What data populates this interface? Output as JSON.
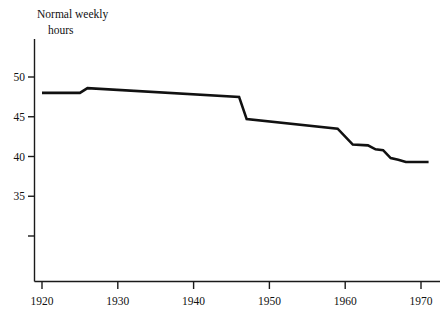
{
  "chart_data": {
    "type": "line",
    "title": "",
    "subtitle": "",
    "ylabel_lines": [
      "Normal weekly",
      "hours"
    ],
    "xlabel": "",
    "ylabel": "Normal weekly hours",
    "grid": false,
    "legend": false,
    "legend_position": "none",
    "xlim": [
      1920,
      1971
    ],
    "ylim": [
      28.5,
      53.5
    ],
    "xticks": [
      1920,
      1930,
      1940,
      1950,
      1960,
      1970
    ],
    "xtick_labels": [
      "1920",
      "1930",
      "1940",
      "1950",
      "1960",
      "1970"
    ],
    "yticks": [
      50,
      45,
      40,
      35,
      30
    ],
    "ytick_labels": [
      "50",
      "45",
      "40",
      "35",
      ""
    ],
    "series": [
      {
        "name": "Normal weekly hours",
        "color": "#111111",
        "x": [
          1920,
          1925,
          1926,
          1946,
          1947,
          1959,
          1961,
          1963,
          1964,
          1965,
          1966,
          1967,
          1968,
          1971
        ],
        "values": [
          48.0,
          48.0,
          48.6,
          47.5,
          44.7,
          43.5,
          41.5,
          41.4,
          40.9,
          40.8,
          39.8,
          39.6,
          39.3,
          39.3
        ]
      }
    ],
    "annotations": []
  },
  "axis_titles": {
    "y_line1": "Normal weekly",
    "y_line2": "hours"
  },
  "colors": {
    "line": "#111111",
    "axis": "#1a1a1a",
    "background": "#ffffff",
    "text": "#111111"
  }
}
